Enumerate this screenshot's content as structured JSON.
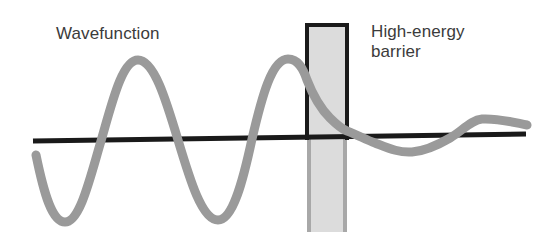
{
  "figure": {
    "title_alt": "Quantum tunnelling of a wavefunction through a high-energy barrier",
    "background_color": "#ffffff",
    "labels": {
      "wavefunction": "Wavefunction",
      "barrier_line1": "High-energy",
      "barrier_line2": "barrier"
    },
    "colors": {
      "wave": "#9a9a9a",
      "axis": "#1a1a1a",
      "barrier_fill": "#dcdcdc",
      "barrier_stroke_upper": "#1a1a1a",
      "barrier_stroke_lower": "#a8a8a8",
      "text": "#3b3b3b"
    },
    "axis": {
      "x_start": 33,
      "y_start": 141,
      "x_end": 526,
      "y_end": 134,
      "stroke_width": 5
    },
    "barrier": {
      "x": 307,
      "y_top": 23,
      "width": 40,
      "y_bottom": 232,
      "stroke_width": 4
    },
    "wave": {
      "stroke_width": 9,
      "description": "Sinusoid of constant amplitude on the left, exponential decay inside the barrier, small-amplitude sinusoid on the right",
      "points": [
        {
          "x": 36,
          "y": 155,
          "kind": "start"
        },
        {
          "x": 65,
          "y": 222,
          "kind": "trough"
        },
        {
          "x": 101,
          "y": 141,
          "kind": "zero-crossing"
        },
        {
          "x": 138,
          "y": 60,
          "kind": "peak"
        },
        {
          "x": 178,
          "y": 140,
          "kind": "zero-crossing"
        },
        {
          "x": 218,
          "y": 220,
          "kind": "trough"
        },
        {
          "x": 252,
          "y": 139,
          "kind": "zero-crossing"
        },
        {
          "x": 288,
          "y": 59,
          "kind": "peak"
        },
        {
          "x": 307,
          "y": 80,
          "kind": "barrier-entry"
        },
        {
          "x": 330,
          "y": 112,
          "kind": "decay"
        },
        {
          "x": 347,
          "y": 130,
          "kind": "barrier-exit"
        },
        {
          "x": 375,
          "y": 142,
          "kind": "zero-crossing"
        },
        {
          "x": 412,
          "y": 152,
          "kind": "trough"
        },
        {
          "x": 450,
          "y": 136,
          "kind": "zero-crossing"
        },
        {
          "x": 482,
          "y": 119,
          "kind": "peak"
        },
        {
          "x": 527,
          "y": 125,
          "kind": "end"
        }
      ]
    }
  }
}
